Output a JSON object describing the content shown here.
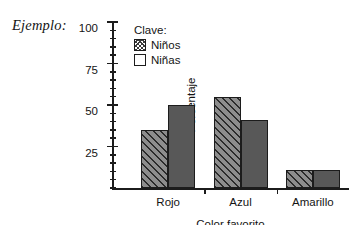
{
  "example_label": "Ejemplo:",
  "legend": {
    "title": "Clave:",
    "entries": [
      {
        "label": "Niños",
        "swatch": "hatched-square-icon"
      },
      {
        "label": "Niñas",
        "swatch": "empty-square-icon"
      }
    ]
  },
  "chart_data": {
    "type": "bar",
    "title": "",
    "xlabel": "Color favorito",
    "ylabel": "Porcentaje",
    "categories": [
      "Rojo",
      "Azul",
      "Amarillo"
    ],
    "series": [
      {
        "name": "Niños",
        "values": [
          35,
          55,
          11
        ],
        "fill": "#8d8d8d",
        "pattern": "diagonal-hatch"
      },
      {
        "name": "Niñas",
        "values": [
          50,
          41,
          11
        ],
        "fill": "#585858",
        "pattern": "solid"
      }
    ],
    "ylim": [
      0,
      100
    ],
    "ytick_labels": [
      "25",
      "50",
      "75",
      "100"
    ],
    "ytick_values": [
      25,
      50,
      75,
      100
    ],
    "yminor_step": 5,
    "grid": false,
    "legend_position": "inside-upper-left"
  }
}
